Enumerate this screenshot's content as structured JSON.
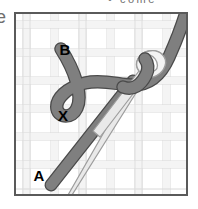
{
  "page": {
    "kind": "embroidery-stitch-diagram",
    "top_caption_fragment": "•   come",
    "left_glyph_fragment": "e"
  },
  "panel": {
    "border_color": "#5a5a5a",
    "background_color": "#ffffff",
    "fabric": {
      "name": "aida-woven-fabric-grid",
      "weave_color": "#d6d6d6",
      "weave_shadow_color": "#eaeaea",
      "cell_size": 28,
      "vertical_band_x": [
        8,
        36,
        64,
        92,
        120,
        148
      ],
      "horizontal_band_y": [
        8,
        36,
        64,
        92,
        120,
        148,
        176
      ]
    },
    "labels": [
      {
        "id": "point-b",
        "text": "B",
        "x": 50,
        "y": 42
      },
      {
        "id": "point-x",
        "text": "X",
        "x": 48,
        "y": 108
      },
      {
        "id": "point-a",
        "text": "A",
        "x": 24,
        "y": 168
      }
    ],
    "needle": {
      "name": "sewing-needle",
      "body_fill": "#e8e8e8",
      "body_stroke": "#9a9a9a",
      "point_stroke": "#808080",
      "eye_fill": "#f2f2f2",
      "eye_stroke": "#9a9a9a",
      "tip": {
        "x": 60,
        "y": 185
      },
      "eye_center": {
        "x": 135,
        "y": 60
      },
      "orientation": "lower-left to upper-right"
    },
    "thread": {
      "name": "embroidery-thread",
      "fill": "#7f7f7f",
      "stroke": "#4a4a4a",
      "width": 11,
      "path_description": "from B down-right, loops under and around the needle, exits up to the top-right corner"
    },
    "stitch_line": {
      "name": "diagonal-stitch-A-to-B",
      "from": "A",
      "to": "B",
      "fill": "#7f7f7f",
      "stroke": "#4a4a4a"
    }
  },
  "colors": {
    "thread_gray": "#7f7f7f",
    "thread_outline": "#4a4a4a",
    "needle_gray": "#e8e8e8",
    "needle_outline": "#9a9a9a",
    "fabric_line": "#d6d6d6",
    "frame": "#5a5a5a",
    "label_text": "#000000",
    "caption_text": "#6f6f6f"
  }
}
